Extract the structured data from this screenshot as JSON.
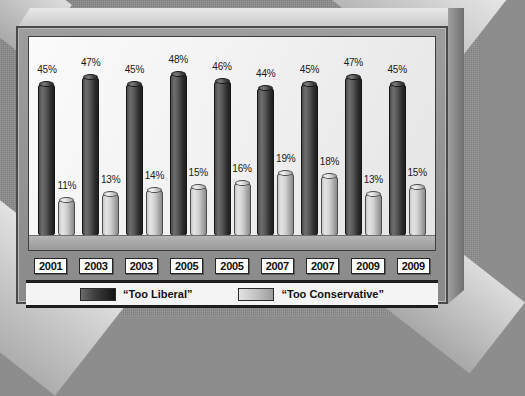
{
  "chart_data": {
    "type": "bar",
    "title": "",
    "xlabel": "",
    "ylabel": "",
    "ylim": [
      0,
      55
    ],
    "grid": false,
    "legend_position": "bottom",
    "categories": [
      "2001",
      "2003",
      "2003",
      "2005",
      "2005",
      "2007",
      "2007",
      "2009",
      "2009"
    ],
    "series": [
      {
        "name": "“Too Liberal”",
        "color": "#3a3a3a",
        "values": [
          45,
          47,
          45,
          48,
          46,
          44,
          45,
          47,
          45
        ],
        "labels": [
          "45%",
          "47%",
          "45%",
          "48%",
          "46%",
          "44%",
          "45%",
          "47%",
          "45%"
        ]
      },
      {
        "name": "“Too Conservative”",
        "color": "#c6c6c6",
        "values": [
          11,
          13,
          14,
          15,
          16,
          19,
          18,
          13,
          15
        ],
        "labels": [
          "11%",
          "13%",
          "14%",
          "15%",
          "16%",
          "19%",
          "18%",
          "13%",
          "15%"
        ]
      }
    ]
  },
  "legend": {
    "items": [
      {
        "label": "“Too Liberal”",
        "swatch": "dark"
      },
      {
        "label": "“Too Conservative”",
        "swatch": "light"
      }
    ]
  }
}
